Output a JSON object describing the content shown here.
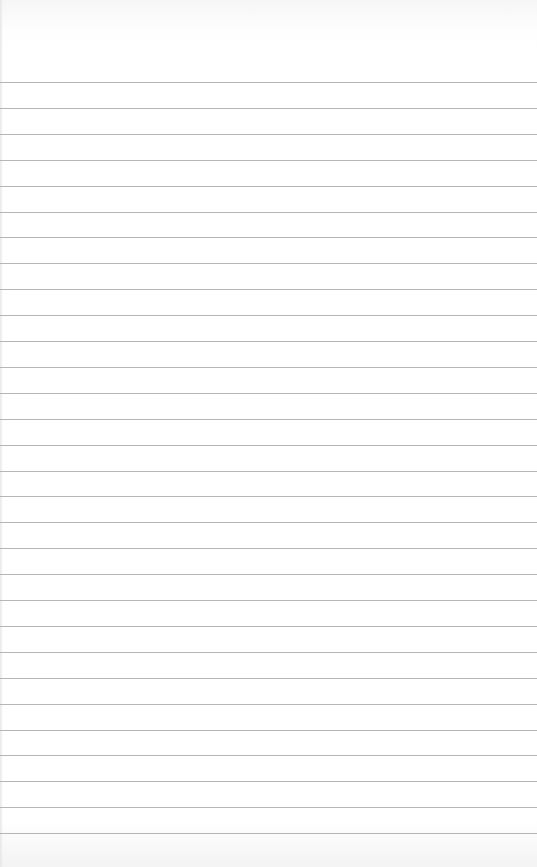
{
  "paper": {
    "type": "lined-notebook-page",
    "background_color": "#ffffff",
    "line_color": "#a9a9a9",
    "first_line_y": 82,
    "line_spacing": 25.9,
    "line_count": 30,
    "text": ""
  }
}
